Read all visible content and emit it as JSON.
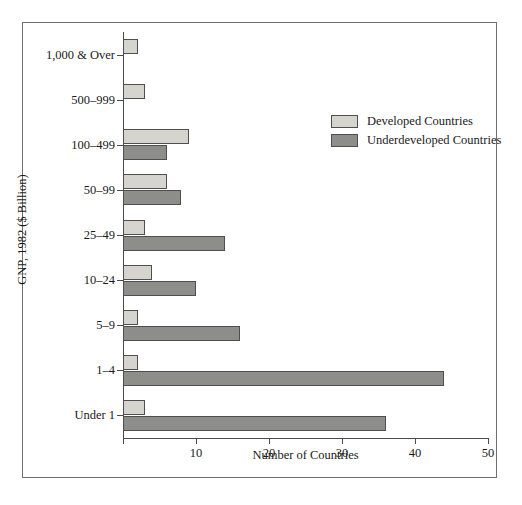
{
  "chart_data": {
    "type": "bar",
    "orientation": "horizontal",
    "title": "",
    "xlabel": "Number of Countries",
    "ylabel": "GNP, 1982 ($ Billion)",
    "xlim": [
      0,
      50
    ],
    "xticks": [
      0,
      10,
      20,
      30,
      40,
      50
    ],
    "xticklabels": [
      "",
      "10",
      "20",
      "30",
      "40",
      "50"
    ],
    "grid": false,
    "legend_position": "upper right",
    "categories": [
      "1,000 & Over",
      "500–999",
      "100–499",
      "50–99",
      "25–49",
      "10–24",
      "5–9",
      "1–4",
      "Under 1"
    ],
    "series": [
      {
        "name": "Developed  Countries",
        "color": "#d6d4cf",
        "values": [
          2,
          3,
          9,
          6,
          3,
          4,
          2,
          2,
          3
        ]
      },
      {
        "name": "Underdeveloped  Countries",
        "color": "#8d8d8a",
        "values": [
          0,
          0,
          6,
          8,
          14,
          10,
          16,
          44,
          36
        ]
      }
    ]
  },
  "axes": {
    "x_title": "Number of Countries",
    "y_title": "GNP, 1982 ($ Billion)",
    "x_tick_labels": [
      "",
      "10",
      "20",
      "30",
      "40",
      "50"
    ]
  },
  "legend": {
    "entries": [
      {
        "label": "Developed  Countries",
        "color": "#d6d4cf"
      },
      {
        "label": "Underdeveloped  Countries",
        "color": "#8d8d8a"
      }
    ]
  },
  "colors": {
    "developed": "#d6d4cf",
    "underdeveloped": "#8d8d8a",
    "axis": "#4a4a4a",
    "frame": "#6f6f6f",
    "text": "#1a1a1a",
    "background": "#ffffff"
  }
}
